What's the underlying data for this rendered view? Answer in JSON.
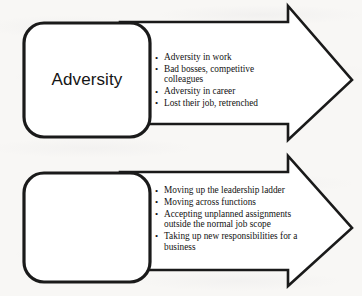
{
  "diagram": {
    "background_color": "#f8f7f5",
    "stroke_color": "#1a1a1a",
    "fill_color": "#ffffff",
    "blocks": [
      {
        "id": "adversity",
        "label": "Adversity",
        "shape": "rounded-rectangle-with-block-arrow",
        "arrow_direction": "right",
        "bullets": [
          "Adversity in work",
          "Bad bosses, competitive colleagues",
          "Adversity in career",
          "Lost their job, retrenched"
        ]
      },
      {
        "id": "diversity",
        "label": "Diversity",
        "shape": "rounded-rectangle-with-block-arrow",
        "arrow_direction": "right",
        "bullets": [
          "Moving up the leadership ladder",
          "Moving across functions",
          "Accepting unplanned assignments outside the normal job scope",
          "Taking up new responsibilities for a business"
        ]
      }
    ]
  }
}
